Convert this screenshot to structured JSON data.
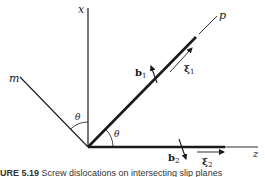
{
  "figure": {
    "labels": {
      "x_axis": "x",
      "z_axis": "z",
      "p_axis": "p",
      "m_axis": "m",
      "theta_upper": "θ",
      "theta_lower": "θ",
      "b1": "b",
      "b1_sub": "1",
      "xi1": "ξ",
      "xi1_sub": "1",
      "b2": "b",
      "b2_sub": "2",
      "xi2": "ξ",
      "xi2_sub": "2"
    },
    "geometry": {
      "origin": [
        88,
        147
      ],
      "x_axis_end": [
        88,
        8
      ],
      "m_line_end": [
        20,
        77
      ],
      "p_thick_end": [
        196,
        37
      ],
      "p_thin_end": [
        217,
        15
      ],
      "z_thick_end": [
        225,
        147
      ],
      "z_thin_end": [
        258,
        147
      ]
    },
    "colors": {
      "line": "#1a1a1a",
      "background": "#ffffff"
    }
  },
  "caption": {
    "figure_number": "URE 5.19",
    "text": "Screw dislocations on intersecting slip planes"
  }
}
